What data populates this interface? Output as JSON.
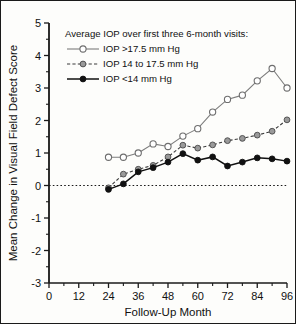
{
  "chart_data": {
    "type": "line",
    "title": "",
    "xlabel": "Follow-Up Month",
    "ylabel": "Mean Change in Visual Field Defect Score",
    "xlim": [
      0,
      96
    ],
    "ylim": [
      -3,
      5
    ],
    "grid": false,
    "legend_position": "upper-left-inside",
    "legend_title": "Average IOP over first three 6-month visits:",
    "xticks": [
      0,
      12,
      24,
      36,
      48,
      60,
      72,
      84,
      96
    ],
    "xtick_labels": [
      "0",
      "12",
      "24",
      "36",
      "48",
      "60",
      "72",
      "84",
      "96"
    ],
    "xticks_minor": [
      6,
      18,
      30,
      42,
      54,
      66,
      78,
      90
    ],
    "yticks": [
      -3,
      -2,
      -1,
      0,
      1,
      2,
      3,
      4,
      5
    ],
    "ytick_labels": [
      "-3",
      "-2",
      "-1",
      "0",
      "1",
      "2",
      "3",
      "4",
      "5"
    ],
    "zero_reference_line": 0,
    "series": [
      {
        "name": "IOP >17.5 mm Hg",
        "marker": "open-circle",
        "linestyle": "solid",
        "color": "#6e6e6e",
        "x": [
          24,
          30,
          36,
          42,
          48,
          54,
          60,
          66,
          72,
          78,
          84,
          90,
          96
        ],
        "values": [
          0.87,
          0.87,
          1.0,
          1.28,
          1.2,
          1.52,
          1.75,
          2.26,
          2.65,
          2.78,
          3.22,
          3.6,
          3.0
        ]
      },
      {
        "name": "IOP 14 to 17.5 mm Hg",
        "marker": "filled-gray-circle",
        "linestyle": "dashed",
        "color": "#9a9a9a",
        "x": [
          24,
          30,
          36,
          42,
          48,
          54,
          60,
          66,
          72,
          78,
          84,
          90,
          96
        ],
        "values": [
          -0.07,
          0.35,
          0.5,
          0.62,
          0.88,
          1.24,
          1.15,
          1.25,
          1.38,
          1.45,
          1.55,
          1.67,
          2.02
        ]
      },
      {
        "name": "IOP <14 mm Hg",
        "marker": "filled-black-circle",
        "linestyle": "solid",
        "color": "#111111",
        "x": [
          24,
          30,
          36,
          42,
          48,
          54,
          60,
          66,
          72,
          78,
          84,
          90,
          96
        ],
        "values": [
          -0.12,
          0.05,
          0.42,
          0.55,
          0.72,
          0.98,
          0.78,
          0.88,
          0.6,
          0.72,
          0.85,
          0.82,
          0.75
        ]
      }
    ]
  },
  "legend": {
    "title": "Average IOP over first three 6-month visits:",
    "entries": [
      {
        "label": "IOP >17.5 mm Hg"
      },
      {
        "label": "IOP 14 to 17.5 mm Hg"
      },
      {
        "label": "IOP <14 mm Hg"
      }
    ]
  },
  "axes": {
    "x_title": "Follow-Up Month",
    "y_title": "Mean Change in Visual Field Defect Score"
  }
}
